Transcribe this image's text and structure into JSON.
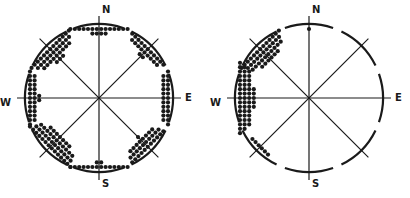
{
  "colors": {
    "ink": "#1a1a1a",
    "background": "#ffffff"
  },
  "diagrams": [
    {
      "name": "left-rose",
      "center": [
        99,
        98
      ],
      "radius": 74,
      "labels": {
        "N": "N",
        "E": "E",
        "S": "S",
        "W": "W"
      },
      "clusters": [
        {
          "dir": "N",
          "angle": -90,
          "count": 18,
          "spread": 18,
          "rows": 5
        },
        {
          "dir": "NE",
          "angle": -45,
          "count": 22,
          "spread": 14,
          "rows": 6
        },
        {
          "dir": "E",
          "angle": 0,
          "count": 24,
          "spread": 16,
          "rows": 6
        },
        {
          "dir": "SE",
          "angle": 45,
          "count": 30,
          "spread": 14,
          "rows": 7
        },
        {
          "dir": "S",
          "angle": 90,
          "count": 16,
          "spread": 18,
          "rows": 5
        },
        {
          "dir": "SW",
          "angle": 135,
          "count": 44,
          "spread": 18,
          "rows": 8
        },
        {
          "dir": "W",
          "angle": 180,
          "count": 26,
          "spread": 16,
          "rows": 6
        },
        {
          "dir": "NW",
          "angle": -135,
          "count": 36,
          "spread": 16,
          "rows": 7
        }
      ]
    },
    {
      "name": "right-rose",
      "center": [
        309,
        98
      ],
      "radius": 74,
      "labels": {
        "N": "N",
        "E": "E",
        "S": "S",
        "W": "W"
      },
      "clusters": [
        {
          "dir": "N",
          "angle": -90,
          "count": 1,
          "spread": 0,
          "rows": 1
        },
        {
          "dir": "NW",
          "angle": -135,
          "count": 40,
          "spread": 16,
          "rows": 8
        },
        {
          "dir": "W",
          "angle": 180,
          "count": 50,
          "spread": 22,
          "rows": 8
        },
        {
          "dir": "SW",
          "angle": 135,
          "count": 6,
          "spread": 10,
          "rows": 2
        }
      ]
    }
  ]
}
